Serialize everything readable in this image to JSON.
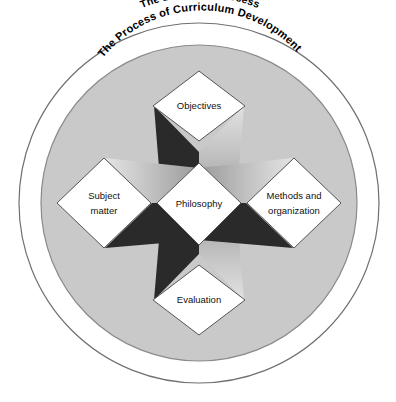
{
  "diagram": {
    "title": "The Educative Process",
    "rings": [
      {
        "id": "outer-ring",
        "label": "The Educative Process"
      },
      {
        "id": "inner-ring",
        "label": "The Process of Curriculum Development"
      }
    ],
    "center_node": {
      "id": "philosophy",
      "label": "Philosophy"
    },
    "nodes": [
      {
        "id": "objectives",
        "label": "Objectives",
        "position": "top"
      },
      {
        "id": "subject-matter",
        "label": "Subject matter",
        "line1": "Subject",
        "line2": "matter",
        "position": "left"
      },
      {
        "id": "methods-and-organization",
        "label": "Methods and organization",
        "line1": "Methods and",
        "line2": "organization",
        "position": "right"
      },
      {
        "id": "evaluation",
        "label": "Evaluation",
        "position": "bottom"
      }
    ],
    "colors": {
      "page_background": "#ffffff",
      "outer_ring_fill": "#ffffff",
      "inner_disc_fill": "#c9c9c9",
      "ring_stroke": "#707070",
      "diamond_fill": "#ffffff",
      "diamond_stroke": "#555555",
      "arm_dark": "#2a2a2a",
      "arm_light": "#b9b9b9",
      "label_text": "#111111",
      "ring_label_text": "#000000"
    }
  }
}
